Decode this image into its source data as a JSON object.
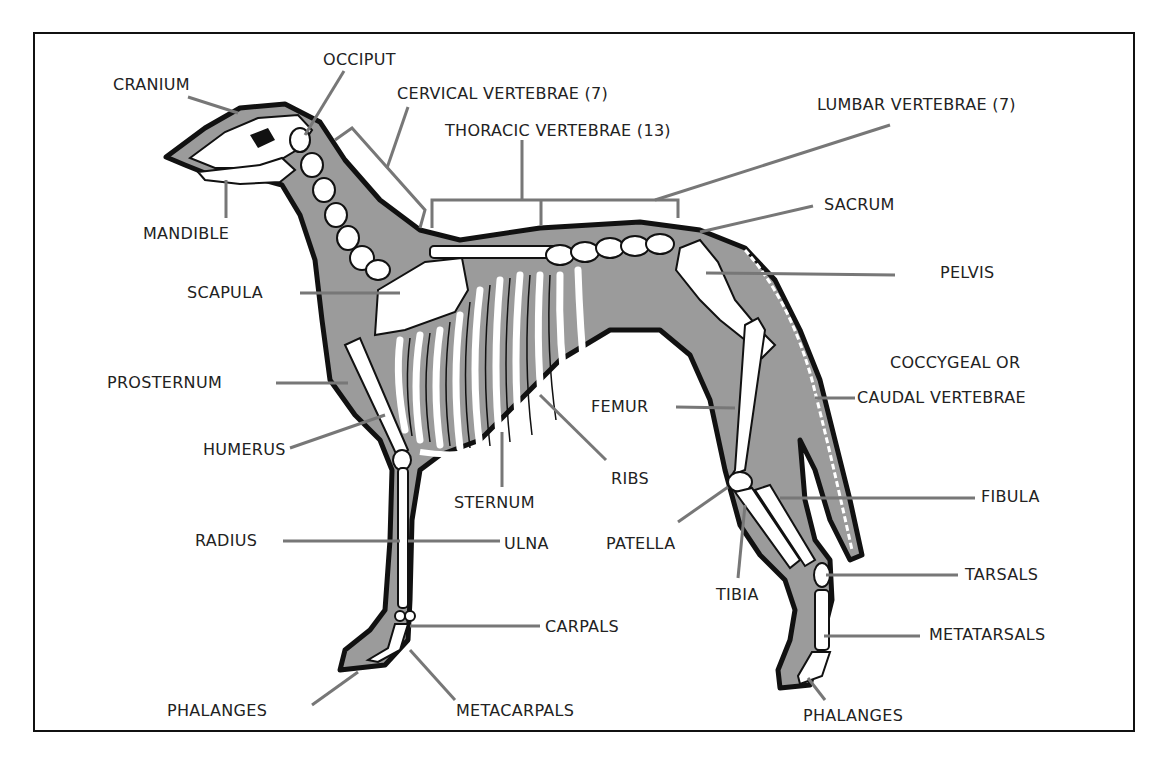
{
  "diagram": {
    "colors": {
      "body_fill": "#9b9b9b",
      "outline": "#111111",
      "bone": "#ffffff",
      "leader_line": "#777777",
      "text": "#222222",
      "frame": "#111111"
    },
    "labels": [
      {
        "id": "cranium",
        "text": "CRANIUM",
        "x": 113,
        "y": 76
      },
      {
        "id": "occiput",
        "text": "OCCIPUT",
        "x": 323,
        "y": 51
      },
      {
        "id": "cervical",
        "text": "CERVICAL VERTEBRAE (7)",
        "x": 397,
        "y": 85
      },
      {
        "id": "thoracic",
        "text": "THORACIC VERTEBRAE (13)",
        "x": 445,
        "y": 122
      },
      {
        "id": "lumbar",
        "text": "LUMBAR VERTEBRAE (7)",
        "x": 817,
        "y": 96
      },
      {
        "id": "mandible",
        "text": "MANDIBLE",
        "x": 143,
        "y": 225
      },
      {
        "id": "sacrum",
        "text": "SACRUM",
        "x": 824,
        "y": 196
      },
      {
        "id": "scapula",
        "text": "SCAPULA",
        "x": 187,
        "y": 284
      },
      {
        "id": "pelvis",
        "text": "PELVIS",
        "x": 940,
        "y": 264
      },
      {
        "id": "coccygeal1",
        "text": "COCCYGEAL OR",
        "x": 890,
        "y": 354
      },
      {
        "id": "coccygeal2",
        "text": "CAUDAL VERTEBRAE",
        "x": 857,
        "y": 389
      },
      {
        "id": "prosternum",
        "text": "PROSTERNUM",
        "x": 107,
        "y": 374
      },
      {
        "id": "femur",
        "text": "FEMUR",
        "x": 591,
        "y": 398
      },
      {
        "id": "humerus",
        "text": "HUMERUS",
        "x": 203,
        "y": 441
      },
      {
        "id": "ribs",
        "text": "RIBS",
        "x": 611,
        "y": 470
      },
      {
        "id": "sternum",
        "text": "STERNUM",
        "x": 454,
        "y": 494
      },
      {
        "id": "fibula",
        "text": "FIBULA",
        "x": 981,
        "y": 488
      },
      {
        "id": "radius",
        "text": "RADIUS",
        "x": 195,
        "y": 532
      },
      {
        "id": "ulna",
        "text": "ULNA",
        "x": 504,
        "y": 535
      },
      {
        "id": "patella",
        "text": "PATELLA",
        "x": 606,
        "y": 535
      },
      {
        "id": "tibia",
        "text": "TIBIA",
        "x": 716,
        "y": 586
      },
      {
        "id": "tarsals",
        "text": "TARSALS",
        "x": 965,
        "y": 566
      },
      {
        "id": "carpals",
        "text": "CARPALS",
        "x": 545,
        "y": 618
      },
      {
        "id": "metatarsals",
        "text": "METATARSALS",
        "x": 929,
        "y": 626
      },
      {
        "id": "phalanges_front",
        "text": "PHALANGES",
        "x": 167,
        "y": 702
      },
      {
        "id": "metacarpals",
        "text": "METACARPALS",
        "x": 456,
        "y": 702
      },
      {
        "id": "phalanges_hind",
        "text": "PHALANGES",
        "x": 803,
        "y": 707
      }
    ]
  }
}
